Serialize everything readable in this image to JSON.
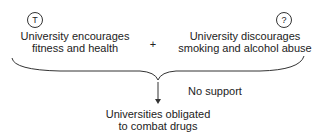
{
  "diagram": {
    "premises": [
      {
        "marker": "T",
        "text_line1": "University encourages",
        "text_line2": "fitness and health"
      },
      {
        "marker": "?",
        "text_line1": "University discourages",
        "text_line2": "smoking and alcohol abuse"
      }
    ],
    "operator": "+",
    "support_label": "No support",
    "conclusion": {
      "text_line1": "Universities obligated",
      "text_line2": "to combat drugs"
    }
  }
}
